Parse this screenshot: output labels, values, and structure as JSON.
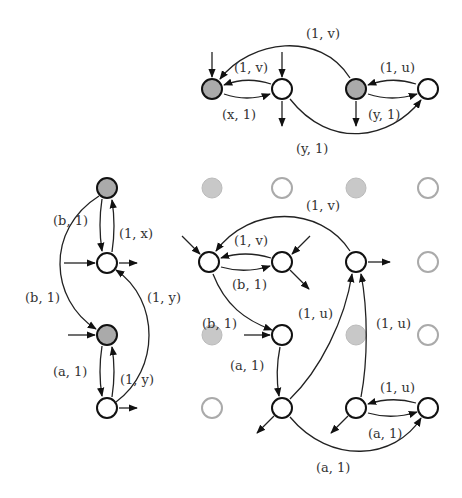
{
  "diagram": {
    "type": "transducer-automata",
    "top": {
      "nodes": [
        {
          "id": "t1",
          "shade": "gray"
        },
        {
          "id": "t2",
          "shade": "white"
        },
        {
          "id": "t3",
          "shade": "gray"
        },
        {
          "id": "t4",
          "shade": "white"
        }
      ],
      "labels": {
        "outer_arc": "(1, v)",
        "t2_t1": "(1, v)",
        "t1_t2": "(x, 1)",
        "t4_t3": "(1, u)",
        "t3_t4": "(y, 1)",
        "t2_t4": "(y, 1)"
      }
    },
    "left": {
      "nodes": [
        {
          "id": "l1",
          "shade": "gray"
        },
        {
          "id": "l2",
          "shade": "white"
        },
        {
          "id": "l3",
          "shade": "gray"
        },
        {
          "id": "l4",
          "shade": "white"
        }
      ],
      "labels": {
        "l1_l2": "(b, 1)",
        "l2_l1": "(1, x)",
        "l1_l3": "(b, 1)",
        "l4_l2": "(1, y)",
        "l3_l4": "(a, 1)",
        "l4_l3": "(1, y)"
      }
    },
    "grid": {
      "labels": {
        "outer_arc": "(1, v)",
        "b_a": "(1, v)",
        "a_b": "(b, 1)",
        "a_down": "(b, 1)",
        "c_to_g": "(1, u)",
        "d_to_c": "(1, u)",
        "e_f": "(a, 1)",
        "h_g": "(1, u)",
        "g_h": "(a, 1)",
        "f_h": "(a, 1)"
      }
    }
  }
}
